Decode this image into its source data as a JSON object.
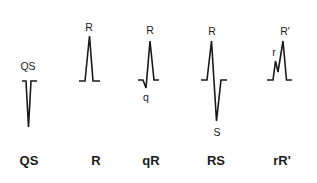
{
  "diagram": {
    "complexes": [
      {
        "name": "QS",
        "caption": "QS",
        "wave_labels": [
          "QS"
        ],
        "path": "M22,81 L26,81 L28.5,127 L31,81 L37,81"
      },
      {
        "name": "R",
        "caption": "R",
        "wave_labels": [
          "R"
        ],
        "path": "M79,81 L85,81 L89.5,36 L93,81 L100,81"
      },
      {
        "name": "qR",
        "caption": "qR",
        "wave_labels": [
          "R",
          "q"
        ],
        "path": "M138,80 L143,80 L146,88 L150,41 L154,80 L159,80"
      },
      {
        "name": "RS",
        "caption": "RS",
        "wave_labels": [
          "R",
          "S"
        ],
        "path": "M201,80 L207,80 L211.5,41 L216.5,121 L221,80 L227,80"
      },
      {
        "name": "rR'",
        "caption": "rR'",
        "wave_labels": [
          "r",
          "R'"
        ],
        "path": "M267,80 L273,80 L275.5,61 L278,72 L283,41 L286.5,80 L292,80"
      }
    ],
    "colors": {
      "stroke": "#1a1a1a",
      "background": "#ffffff"
    }
  }
}
